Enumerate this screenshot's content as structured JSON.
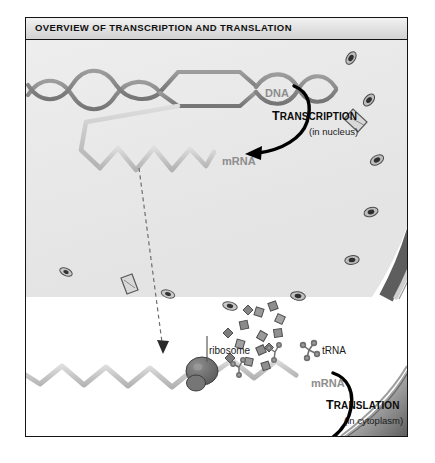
{
  "figure": {
    "title": "OVERVIEW OF TRANSCRIPTION AND TRANSLATION",
    "domain_description": "Biology textbook illustration of gene expression",
    "colors": {
      "frame_border": "#141414",
      "titlebar_top": "#f2f2f2",
      "titlebar_bottom": "#d2d2d2",
      "nucleus_fill": "#efefef",
      "nuclear_envelope": "#6e6e6e",
      "dna_strand": "#8a8a8a",
      "mrna_strand": "#c9c9c9",
      "ribosome": "#6a6a6a",
      "protein_bead": "#5e5e5e",
      "label_grey": "#8d8d8d",
      "label_dark": "#0b0b0b",
      "arrow_black": "#000000"
    }
  },
  "labels": {
    "dna": "DNA",
    "mrna_nucleus": "mRNA",
    "mrna_cytoplasm": "mRNA",
    "ribosome": "ribosome",
    "trna": "tRNA",
    "protein": "protein"
  },
  "processes": [
    {
      "name": "TRANSCRIPTION",
      "first_letter": "T",
      "rest": "RANSCRIPTION",
      "location": "(in nucleus)",
      "compartment": "nucleus"
    },
    {
      "name": "TRANSLATION",
      "first_letter": "T",
      "rest": "RANSLATION",
      "location": "(in cytoplasm)",
      "compartment": "cytoplasm"
    }
  ],
  "structures": {
    "nucleus": "nucleus with nuclear envelope and nuclear pores",
    "nuclear_pore_count": 9,
    "dna": "double helix with open transcription bubble",
    "mrna": "single stranded zigzag ribbon",
    "ribosome": "large dark subunit complex on mRNA",
    "trna": "cloverleaf shaped transfer RNA carrying amino acids",
    "amino_acids": "small squares and diamonds floating in cytoplasm",
    "protein": "beaded polypeptide chain emerging from ribosome",
    "cell_membrane": "curved plasma membrane edge at lower right"
  }
}
